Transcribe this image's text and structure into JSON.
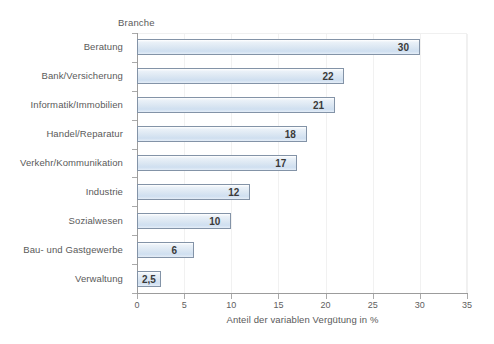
{
  "chart_data": {
    "type": "bar",
    "orientation": "horizontal",
    "title": "",
    "ylabel": "Branche",
    "xlabel": "Anteil der variablen Vergütung in %",
    "xlim": [
      0,
      35
    ],
    "xticks": [
      0,
      5,
      10,
      15,
      20,
      25,
      30,
      35
    ],
    "xtick_labels": [
      "0",
      "5",
      "10",
      "15",
      "20",
      "25",
      "30",
      "35"
    ],
    "grid": true,
    "legend": null,
    "categories": [
      "Beratung",
      "Bank/Versicherung",
      "Informatik/Immobilien",
      "Handel/Reparatur",
      "Verkehr/Kommunikation",
      "Industrie",
      "Sozialwesen",
      "Bau- und Gastgewerbe",
      "Verwaltung"
    ],
    "values": [
      30,
      22,
      21,
      18,
      17,
      12,
      10,
      6,
      2.5
    ],
    "value_labels": [
      "30",
      "22",
      "21",
      "18",
      "17",
      "12",
      "10",
      "6",
      "2,5"
    ],
    "colors": {
      "bar_fill": "#dae6f2",
      "bar_border": "#8393a7",
      "axis": "#9c9c9c",
      "grid": "#f1f1f1",
      "text": "#5a5a5a",
      "value_text": "#3a3a3a",
      "background": "#ffffff"
    }
  }
}
